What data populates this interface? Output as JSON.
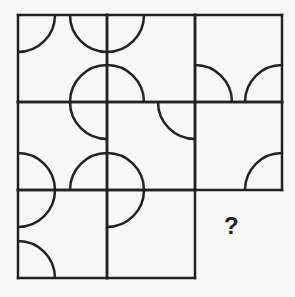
{
  "puzzle": {
    "question_mark": "?",
    "grid": {
      "rows": 3,
      "cols": 3,
      "x_lines": [
        18,
        107,
        195,
        282
      ],
      "y_lines": [
        15,
        102,
        190,
        278
      ],
      "stroke_color": "#222222",
      "stroke_width": 2.5,
      "missing_cell": {
        "row": 2,
        "col": 2
      }
    },
    "arc_radius": 37,
    "arcs": [
      {
        "cx": 18,
        "cy": 15,
        "quadrant": "br",
        "cell": "r0c0"
      },
      {
        "cx": 107,
        "cy": 15,
        "quadrant": "bl",
        "cell": "r0c0"
      },
      {
        "cx": 107,
        "cy": 15,
        "quadrant": "br",
        "cell": "r0c1"
      },
      {
        "cx": 107,
        "cy": 102,
        "quadrant": "tl",
        "cell": "r0c0"
      },
      {
        "cx": 107,
        "cy": 102,
        "quadrant": "tr",
        "cell": "r0c1"
      },
      {
        "cx": 195,
        "cy": 102,
        "quadrant": "tr",
        "cell": "r0c2"
      },
      {
        "cx": 282,
        "cy": 102,
        "quadrant": "tl",
        "cell": "r0c2"
      },
      {
        "cx": 107,
        "cy": 102,
        "quadrant": "bl",
        "cell": "r1c0"
      },
      {
        "cx": 195,
        "cy": 102,
        "quadrant": "bl",
        "cell": "r1c1"
      },
      {
        "cx": 18,
        "cy": 190,
        "quadrant": "tr",
        "cell": "r1c0"
      },
      {
        "cx": 107,
        "cy": 190,
        "quadrant": "tl",
        "cell": "r1c0"
      },
      {
        "cx": 107,
        "cy": 190,
        "quadrant": "tr",
        "cell": "r1c1"
      },
      {
        "cx": 282,
        "cy": 190,
        "quadrant": "tl",
        "cell": "r1c2"
      },
      {
        "cx": 18,
        "cy": 190,
        "quadrant": "br",
        "cell": "r2c0"
      },
      {
        "cx": 18,
        "cy": 278,
        "quadrant": "tr",
        "cell": "r2c0"
      },
      {
        "cx": 107,
        "cy": 190,
        "quadrant": "br",
        "cell": "r2c1"
      }
    ]
  }
}
